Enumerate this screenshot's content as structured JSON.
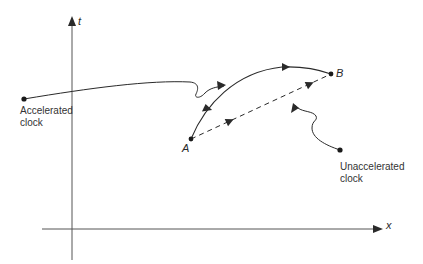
{
  "diagram": {
    "type": "spacetime-diagram",
    "axes": {
      "vertical_label": "t",
      "horizontal_label": "x"
    },
    "events": {
      "start_label": "A",
      "end_label": "B"
    },
    "worldlines": [
      {
        "name": "accelerated",
        "style": "solid-curved",
        "from": "A",
        "to": "B",
        "arrows": 2
      },
      {
        "name": "unaccelerated",
        "style": "dashed-straight",
        "from": "A",
        "to": "B",
        "arrows": 2
      }
    ],
    "annotations": {
      "accelerated_clock": [
        "Accelerated",
        "clock"
      ],
      "unaccelerated_clock": [
        "Unaccelerated",
        "clock"
      ]
    },
    "colors": {
      "line": "#2a2a2a",
      "background": "#ffffff"
    }
  }
}
